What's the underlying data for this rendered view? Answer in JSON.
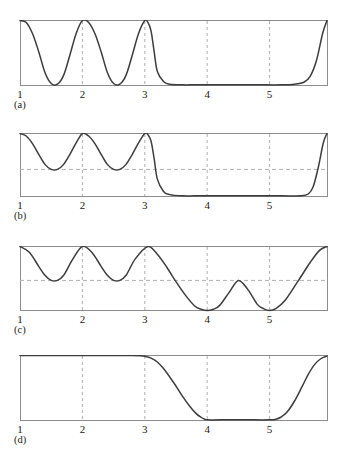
{
  "figure": {
    "width": 345,
    "height": 470,
    "background": "#ffffff",
    "curve_color": "#3d3d3d",
    "frame_color": "#8c8c8c",
    "grid_color": "#b0b0b0",
    "text_color": "#1a1a1a"
  },
  "axis": {
    "x_min": 1,
    "x_max": 5.92,
    "tick_labels": [
      "1",
      "2",
      "3",
      "4",
      "5"
    ],
    "tick_values": [
      1,
      2,
      3,
      4,
      5
    ],
    "gridline_values": [
      2,
      3,
      4,
      5
    ],
    "grid": "dashed-vertical"
  },
  "panels": [
    {
      "caption": "(a)",
      "dashed_hline": false,
      "dashed_hline_value": null,
      "plot_top": 20,
      "plot_height": 65,
      "caption_top": 98
    },
    {
      "caption": "(b)",
      "dashed_hline": true,
      "dashed_hline_value": 0.43,
      "plot_top": 133,
      "plot_height": 63,
      "caption_top": 209
    },
    {
      "caption": "(c)",
      "dashed_hline": true,
      "dashed_hline_value": 0.47,
      "plot_top": 246,
      "plot_height": 64,
      "caption_top": 323
    },
    {
      "caption": "(d)",
      "dashed_hline": false,
      "dashed_hline_value": null,
      "plot_top": 355,
      "plot_height": 65,
      "caption_top": 433
    }
  ],
  "chart_data": {
    "type": "line",
    "title": "",
    "xlabel": "",
    "ylabel": "",
    "xlim": [
      1,
      5.92
    ],
    "ylim": [
      0,
      1
    ],
    "grid": true,
    "legend": "none",
    "panel_count": 4,
    "annotations": [
      "(a)",
      "(b)",
      "(c)",
      "(d)"
    ],
    "series": [
      {
        "name": "(a)",
        "panel": 0,
        "x": [
          1.0,
          1.1,
          1.2,
          1.3,
          1.4,
          1.5,
          1.6,
          1.7,
          1.8,
          1.9,
          2.0,
          2.1,
          2.2,
          2.3,
          2.4,
          2.5,
          2.6,
          2.7,
          2.8,
          2.9,
          3.0,
          3.05,
          3.1,
          3.15,
          3.2,
          3.3,
          3.4,
          3.6,
          3.8,
          4.0,
          4.4,
          4.8,
          5.2,
          5.4,
          5.55,
          5.65,
          5.75,
          5.85,
          5.92
        ],
        "y": [
          1.0,
          0.97,
          0.8,
          0.52,
          0.2,
          0.03,
          0.02,
          0.16,
          0.47,
          0.8,
          1.0,
          0.97,
          0.8,
          0.52,
          0.2,
          0.03,
          0.02,
          0.16,
          0.47,
          0.8,
          1.0,
          0.97,
          0.84,
          0.52,
          0.22,
          0.06,
          0.02,
          0.01,
          0.01,
          0.01,
          0.01,
          0.01,
          0.01,
          0.02,
          0.05,
          0.14,
          0.38,
          0.8,
          1.0
        ]
      },
      {
        "name": "(b)",
        "panel": 1,
        "x": [
          1.0,
          1.1,
          1.2,
          1.3,
          1.4,
          1.5,
          1.6,
          1.7,
          1.8,
          1.9,
          2.0,
          2.1,
          2.2,
          2.3,
          2.4,
          2.5,
          2.6,
          2.7,
          2.8,
          2.9,
          3.0,
          3.05,
          3.1,
          3.15,
          3.2,
          3.3,
          3.4,
          3.6,
          3.8,
          4.0,
          4.4,
          4.8,
          5.2,
          5.5,
          5.62,
          5.7,
          5.78,
          5.86,
          5.92
        ],
        "y": [
          1.0,
          0.96,
          0.84,
          0.67,
          0.51,
          0.43,
          0.43,
          0.51,
          0.67,
          0.85,
          1.0,
          0.96,
          0.84,
          0.67,
          0.51,
          0.43,
          0.43,
          0.51,
          0.67,
          0.85,
          1.0,
          0.98,
          0.88,
          0.6,
          0.28,
          0.08,
          0.03,
          0.01,
          0.01,
          0.01,
          0.01,
          0.01,
          0.01,
          0.01,
          0.04,
          0.16,
          0.46,
          0.85,
          1.0
        ]
      },
      {
        "name": "(c)",
        "panel": 2,
        "x": [
          1.0,
          1.15,
          1.3,
          1.4,
          1.5,
          1.6,
          1.7,
          1.85,
          2.0,
          2.15,
          2.3,
          2.4,
          2.5,
          2.6,
          2.7,
          2.85,
          3.05,
          3.2,
          3.35,
          3.5,
          3.65,
          3.8,
          3.9,
          4.0,
          4.1,
          4.2,
          4.35,
          4.5,
          4.65,
          4.8,
          4.9,
          5.0,
          5.1,
          5.25,
          5.45,
          5.65,
          5.8,
          5.92
        ],
        "y": [
          1.0,
          0.91,
          0.69,
          0.55,
          0.47,
          0.47,
          0.55,
          0.81,
          1.0,
          0.91,
          0.69,
          0.55,
          0.47,
          0.47,
          0.55,
          0.81,
          1.0,
          0.88,
          0.68,
          0.45,
          0.24,
          0.07,
          0.02,
          0.0,
          0.02,
          0.08,
          0.28,
          0.47,
          0.33,
          0.1,
          0.03,
          0.0,
          0.03,
          0.16,
          0.45,
          0.75,
          0.94,
          1.0
        ]
      },
      {
        "name": "(d)",
        "panel": 3,
        "x": [
          1.0,
          1.5,
          2.0,
          2.5,
          2.8,
          3.0,
          3.1,
          3.2,
          3.3,
          3.45,
          3.6,
          3.72,
          3.82,
          3.9,
          3.96,
          4.0,
          4.2,
          4.6,
          5.0,
          5.1,
          5.18,
          5.28,
          5.4,
          5.52,
          5.62,
          5.72,
          5.82,
          5.92
        ],
        "y": [
          1.0,
          1.0,
          1.0,
          1.0,
          1.0,
          0.99,
          0.96,
          0.9,
          0.8,
          0.6,
          0.38,
          0.22,
          0.11,
          0.05,
          0.02,
          0.01,
          0.01,
          0.01,
          0.01,
          0.02,
          0.05,
          0.13,
          0.3,
          0.52,
          0.71,
          0.86,
          0.95,
          0.99
        ]
      }
    ]
  }
}
